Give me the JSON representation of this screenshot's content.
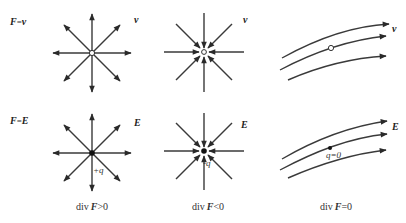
{
  "figure": {
    "row_labels": {
      "top": {
        "lhs": "F",
        "eq": "=",
        "rhs": "v"
      },
      "bottom": {
        "lhs": "F",
        "eq": "=",
        "rhs": "E"
      }
    },
    "panels": [
      {
        "id": "source-v",
        "field_label": "v",
        "center_marker": "open-circle",
        "direction": "outward"
      },
      {
        "id": "sink-v",
        "field_label": "v",
        "center_marker": "open-circle",
        "direction": "inward"
      },
      {
        "id": "uniform-v",
        "field_label": "v",
        "center_marker": "open-circle",
        "direction": "flow"
      },
      {
        "id": "source-E",
        "field_label": "E",
        "charge_label": "+q",
        "center_marker": "filled-dot",
        "direction": "outward"
      },
      {
        "id": "sink-E",
        "field_label": "E",
        "charge_label": "-q",
        "center_marker": "filled-dot",
        "direction": "inward"
      },
      {
        "id": "uniform-E",
        "field_label": "E",
        "charge_label": "q=0",
        "center_marker": "filled-dot",
        "direction": "flow"
      }
    ],
    "captions": [
      {
        "prefix": "div",
        "var": "F",
        "rel": ">0"
      },
      {
        "prefix": "div",
        "var": "F",
        "rel": "<0"
      },
      {
        "prefix": "div",
        "var": "F",
        "rel": "=0"
      }
    ]
  }
}
